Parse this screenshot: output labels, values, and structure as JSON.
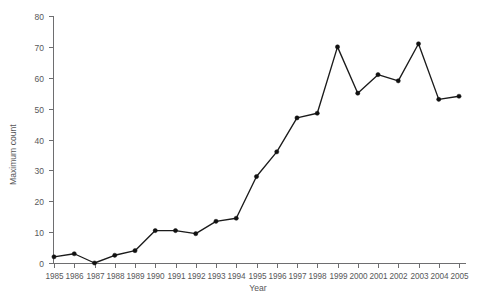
{
  "chart_data": {
    "type": "line",
    "title": "",
    "xlabel": "Year",
    "ylabel": "Maximum count",
    "categories": [
      "1985",
      "1986",
      "1987",
      "1988",
      "1989",
      "1990",
      "1991",
      "1992",
      "1993",
      "1994",
      "1995",
      "1996",
      "1997",
      "1998",
      "1999",
      "2000",
      "2001",
      "2002",
      "2003",
      "2004",
      "2005"
    ],
    "x": [
      1985,
      1986,
      1987,
      1988,
      1989,
      1990,
      1991,
      1992,
      1993,
      1994,
      1995,
      1996,
      1997,
      1998,
      1999,
      2000,
      2001,
      2002,
      2003,
      2004,
      2005
    ],
    "values": [
      2,
      3,
      0,
      2.5,
      4,
      10.5,
      10.5,
      9.5,
      13.5,
      14.5,
      28,
      36,
      47,
      48.5,
      70,
      55,
      61,
      59,
      71,
      53,
      54
    ],
    "series": [
      {
        "name": "Maximum count",
        "values": [
          2,
          3,
          0,
          2.5,
          4,
          10.5,
          10.5,
          9.5,
          13.5,
          14.5,
          28,
          36,
          47,
          48.5,
          70,
          55,
          61,
          59,
          71,
          53,
          54
        ],
        "color": "#111111",
        "marker": "circle"
      }
    ],
    "ylim": [
      0,
      80
    ],
    "yticks": [
      0,
      10,
      20,
      30,
      40,
      50,
      60,
      70,
      80
    ],
    "ytick_labels": [
      "0",
      "10",
      "20",
      "30",
      "40",
      "50",
      "60",
      "70",
      "80"
    ],
    "xlim": [
      1985,
      2005
    ],
    "grid": false,
    "legend": false,
    "legend_position": "none"
  },
  "style": {
    "background": "#ffffff",
    "axis_color": "#6e6e70",
    "text_color": "#58585a",
    "line_color": "#111111"
  }
}
